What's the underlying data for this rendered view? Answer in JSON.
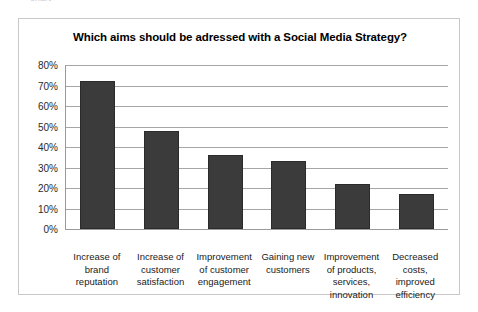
{
  "top_clipped_text": "chart",
  "chart_data": {
    "type": "bar",
    "title": "Which aims should be adressed with a Social Media Strategy?",
    "xlabel": "",
    "ylabel": "",
    "ylim": [
      0,
      80
    ],
    "grid": true,
    "legend": "none",
    "ytick_labels": [
      "80%",
      "70%",
      "60%",
      "50%",
      "40%",
      "30%",
      "20%",
      "10%",
      "0%"
    ],
    "ytick_values": [
      80,
      70,
      60,
      50,
      40,
      30,
      20,
      10,
      0
    ],
    "categories": [
      "Increase of\nbrand\nreputation",
      "Increase of\ncustomer\nsatisfaction",
      "Improvement\nof customer\nengagement",
      "Gaining new\ncustomers",
      "Improvement\nof products,\nservices,\ninnovation",
      "Decreased\ncosts,\nimproved\nefficiency"
    ],
    "values": [
      72,
      48,
      36,
      33,
      22,
      17
    ],
    "bar_color": "#3b3b3b",
    "grid_color": "#a6a6a6",
    "frame_color": "#c8c8c8"
  }
}
